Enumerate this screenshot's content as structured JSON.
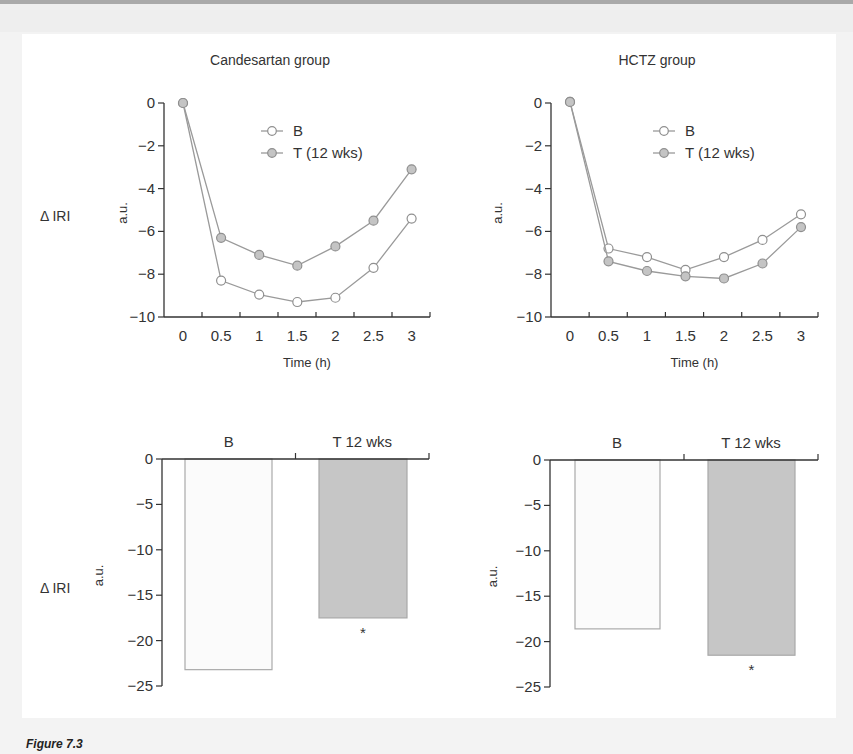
{
  "figure": {
    "caption": "Figure 7.3",
    "row_label_top": "Δ IRI",
    "row_label_bottom": "Δ IRI"
  },
  "colors": {
    "axis": "#333333",
    "line": "#9a9a9a",
    "marker_b_fill": "#ffffff",
    "marker_t_fill": "#c4c4c4",
    "marker_stroke": "#8f8f8f",
    "bar_b_fill": "#fbfbfb",
    "bar_b_stroke": "#aaaaaa",
    "bar_t_fill": "#c6c6c6",
    "bar_t_stroke": "#a8a8a8"
  },
  "chart_data": [
    {
      "id": "candesartan-line",
      "type": "line",
      "title": "Candesartan group",
      "xlabel": "Time (h)",
      "ylabel": "a.u.",
      "x": [
        0,
        0.5,
        1,
        1.5,
        2,
        2.5,
        3
      ],
      "x_tick_labels": [
        "0",
        "0.5",
        "1",
        "1.5",
        "2",
        "2.5",
        "3"
      ],
      "y_ticks": [
        0,
        -2,
        -4,
        -6,
        -8,
        -10
      ],
      "y_tick_labels": [
        "0",
        "−2",
        "−4",
        "−6",
        "−8",
        "−10"
      ],
      "ylim": [
        -10,
        0
      ],
      "grid": false,
      "legend_position": "upper-right",
      "series": [
        {
          "name": "B",
          "marker": "open-circle",
          "values": [
            0,
            -8.3,
            -8.95,
            -9.3,
            -9.1,
            -7.7,
            -5.4
          ]
        },
        {
          "name": "T (12 wks)",
          "marker": "filled-circle",
          "values": [
            0,
            -6.3,
            -7.1,
            -7.6,
            -6.7,
            -5.5,
            -3.1
          ]
        }
      ]
    },
    {
      "id": "hctz-line",
      "type": "line",
      "title": "HCTZ group",
      "xlabel": "Time (h)",
      "ylabel": "a.u.",
      "x": [
        0,
        0.5,
        1,
        1.5,
        2,
        2.5,
        3
      ],
      "x_tick_labels": [
        "0",
        "0.5",
        "1",
        "1.5",
        "2",
        "2.5",
        "3"
      ],
      "y_ticks": [
        0,
        -2,
        -4,
        -6,
        -8,
        -10
      ],
      "y_tick_labels": [
        "0",
        "−2",
        "−4",
        "−6",
        "−8",
        "−10"
      ],
      "ylim": [
        -10,
        0
      ],
      "grid": false,
      "legend_position": "upper-right",
      "series": [
        {
          "name": "B",
          "marker": "open-circle",
          "values": [
            0.05,
            -6.8,
            -7.2,
            -7.8,
            -7.2,
            -6.4,
            -5.2
          ]
        },
        {
          "name": "T (12 wks)",
          "marker": "filled-circle",
          "values": [
            0.05,
            -7.4,
            -7.85,
            -8.1,
            -8.2,
            -7.5,
            -5.8
          ]
        }
      ]
    },
    {
      "id": "candesartan-bar",
      "type": "bar",
      "title": "",
      "xlabel": "",
      "ylabel": "a.u.",
      "categories": [
        "B",
        "T 12 wks"
      ],
      "values": [
        -23.2,
        -17.5
      ],
      "annotations": [
        "",
        "*"
      ],
      "y_ticks": [
        0,
        -5,
        -10,
        -15,
        -20,
        -25
      ],
      "y_tick_labels": [
        "0",
        "−5",
        "−10",
        "−15",
        "−20",
        "−25"
      ],
      "ylim": [
        -25,
        0
      ],
      "grid": false
    },
    {
      "id": "hctz-bar",
      "type": "bar",
      "title": "",
      "xlabel": "",
      "ylabel": "a.u.",
      "categories": [
        "B",
        "T 12 wks"
      ],
      "values": [
        -18.6,
        -21.5
      ],
      "annotations": [
        "",
        "*"
      ],
      "y_ticks": [
        0,
        -5,
        -10,
        -15,
        -20,
        -25
      ],
      "y_tick_labels": [
        "0",
        "−5",
        "−10",
        "−15",
        "−20",
        "−25"
      ],
      "ylim": [
        -25,
        0
      ],
      "grid": false
    }
  ]
}
